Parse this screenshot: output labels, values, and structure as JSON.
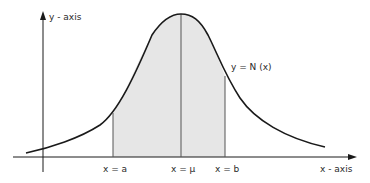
{
  "diagram": {
    "y_axis_label": "y - axis",
    "x_axis_label": "x - axis",
    "curve_label": "y = N (x)",
    "markers": [
      {
        "id": "a",
        "label": "x = a"
      },
      {
        "id": "mu",
        "label": "x = μ"
      },
      {
        "id": "b",
        "label": "x = b"
      }
    ],
    "colors": {
      "line": "#1a1a1a",
      "shade": "#e6e6e6",
      "text": "#2a2a2a"
    }
  }
}
